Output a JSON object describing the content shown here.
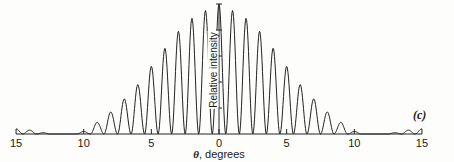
{
  "chart_data": {
    "type": "line",
    "title": "",
    "panel_label": "(c)",
    "xlabel_symbol": "θ",
    "xlabel_text": ", degrees",
    "ylabel": "Relative intensity",
    "x_ticks": [
      -15,
      -10,
      -5,
      0,
      5,
      10,
      15
    ],
    "x_tick_labels": [
      "15",
      "10",
      "5",
      "0",
      "5",
      "10",
      "15"
    ],
    "xlim": [
      -15,
      15
    ],
    "ylim": [
      0,
      1
    ],
    "grid": false,
    "legend": null,
    "peaks": {
      "x": [
        -15,
        -14,
        -13,
        -10,
        -9,
        -8,
        -7,
        -6,
        -5,
        -4,
        -3,
        -2,
        -1,
        0,
        1,
        2,
        3,
        4,
        5,
        6,
        7,
        8,
        9,
        10,
        13,
        14,
        15
      ],
      "y": [
        0.04,
        0.03,
        0.01,
        0.02,
        0.09,
        0.17,
        0.27,
        0.38,
        0.52,
        0.66,
        0.79,
        0.89,
        0.95,
        1.0,
        0.95,
        0.89,
        0.79,
        0.66,
        0.52,
        0.38,
        0.27,
        0.17,
        0.09,
        0.02,
        0.01,
        0.03,
        0.04
      ]
    }
  }
}
